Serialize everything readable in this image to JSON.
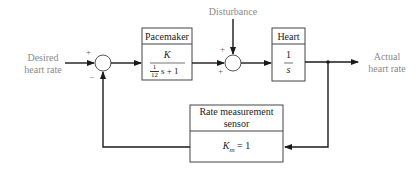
{
  "diagram": {
    "type": "feedback-control-block-diagram",
    "input_label": "Desired\nheart rate",
    "input_label_lines": [
      "Desired",
      "heart rate"
    ],
    "output_label_lines": [
      "Actual",
      "heart rate"
    ],
    "disturbance_label": "Disturbance",
    "junction1": {
      "signs": {
        "left": "+",
        "bottom": "−"
      }
    },
    "junction2": {
      "signs": {
        "top": "+",
        "left": "+"
      }
    },
    "blocks": {
      "pacemaker": {
        "title": "Pacemaker",
        "numerator": "K",
        "denominator_coef_num": "1",
        "denominator_coef_den": "12",
        "denominator_rest": "s + 1"
      },
      "heart": {
        "title": "Heart",
        "numerator": "1",
        "denominator": "s"
      },
      "sensor": {
        "title_lines": [
          "Rate measurement",
          "sensor"
        ],
        "gain_symbol": "K",
        "gain_subscript": "m",
        "gain_value": "= 1"
      }
    },
    "colors": {
      "line": "#1a1a1a",
      "label": "#8a8a8a",
      "block_border": "#444444"
    }
  }
}
